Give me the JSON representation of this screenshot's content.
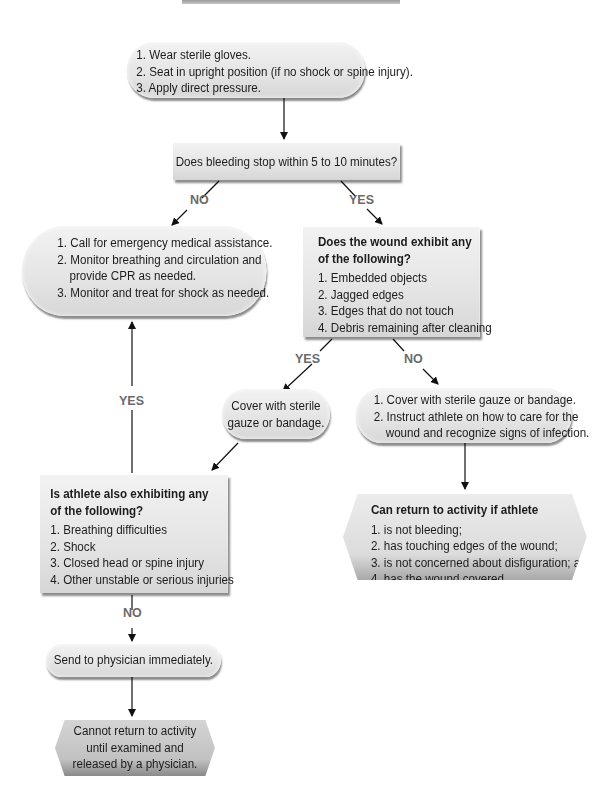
{
  "diagram": {
    "type": "flowchart",
    "start": {
      "items": [
        "1. Wear sterile gloves.",
        "2. Seat in upright position (if no shock or spine injury).",
        "3. Apply direct pressure."
      ]
    },
    "question1": {
      "text": "Does bleeding stop within 5 to 10 minutes?",
      "no_label": "NO",
      "yes_label": "YES"
    },
    "emergency": {
      "items": [
        "1. Call for emergency medical assistance.",
        "2. Monitor breathing and circulation and",
        "provide CPR as needed.",
        "3. Monitor and treat for shock as needed."
      ]
    },
    "question2": {
      "title_line1": "Does the wound exhibit any",
      "title_line2": "of the following?",
      "items": [
        "1. Embedded objects",
        "2. Jagged edges",
        "3. Edges that do not touch",
        "4. Debris remaining after cleaning"
      ],
      "yes_label": "YES",
      "no_label": "NO"
    },
    "cover_simple": {
      "line1": "Cover with sterile",
      "line2": "gauze or bandage."
    },
    "cover_instruct": {
      "items": [
        "1. Cover with sterile gauze or bandage.",
        "2. Instruct athlete on how to care for the",
        "wound and recognize signs of infection."
      ]
    },
    "question3": {
      "title_line1": "Is athlete also exhibiting any",
      "title_line2": "of the following?",
      "items": [
        "1. Breathing difficulties",
        "2. Shock",
        "3. Closed head or spine injury",
        "4. Other unstable or serious injuries"
      ],
      "yes_label": "YES",
      "no_label": "NO"
    },
    "return_ok": {
      "title": "Can return to activity if athlete",
      "items": [
        "1. is not bleeding;",
        "2. has touching edges of the wound;",
        "3. is not concerned about disfiguration; and",
        "4. has the wound covered."
      ]
    },
    "send_physician": {
      "text": "Send to physician immediately."
    },
    "no_return": {
      "line1": "Cannot return to activity",
      "line2": "until examined and",
      "line3": "released by a physician."
    }
  }
}
